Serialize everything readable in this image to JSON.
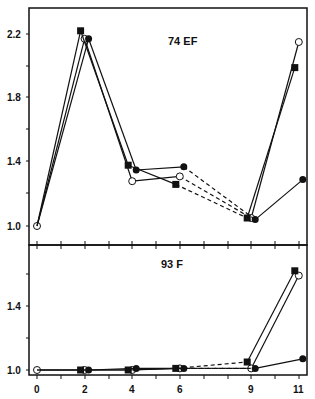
{
  "chart_data": [
    {
      "type": "line",
      "title": "74 EF",
      "xlabel": "",
      "ylabel": "",
      "x": [
        0,
        2,
        4,
        6,
        9,
        11
      ],
      "ylim": [
        0.95,
        2.35
      ],
      "yticks": [
        1.0,
        1.4,
        1.8,
        2.2
      ],
      "ytick_labels": [
        "1.0",
        "1.4",
        "1.8",
        "2.2"
      ],
      "grid": false,
      "series": [
        {
          "name": "open circle",
          "marker": "open-circle",
          "values": [
            1.0,
            2.17,
            1.28,
            1.31,
            1.05,
            2.15
          ]
        },
        {
          "name": "filled square",
          "marker": "filled-square",
          "values": [
            1.0,
            2.22,
            1.38,
            1.26,
            1.05,
            1.99
          ]
        },
        {
          "name": "filled circle",
          "marker": "filled-circle",
          "values": [
            1.0,
            2.17,
            1.35,
            1.37,
            1.04,
            1.29
          ]
        }
      ],
      "notes": "Solid lines between 0-4 and 4-6 and 9-11; dashed lines between 6 and 9"
    },
    {
      "type": "line",
      "title": "93 F",
      "xlabel": "",
      "ylabel": "",
      "x": [
        0,
        2,
        4,
        6,
        9,
        11
      ],
      "xticks": [
        0,
        2,
        4,
        6,
        9,
        11
      ],
      "xtick_labels": [
        "0",
        "2",
        "4",
        "6",
        "9",
        "11"
      ],
      "ylim": [
        0.97,
        1.8
      ],
      "yticks": [
        1.0,
        1.4
      ],
      "ytick_labels": [
        "1.0",
        "1.4"
      ],
      "grid": false,
      "series": [
        {
          "name": "open circle",
          "marker": "open-circle",
          "values": [
            1.0,
            1.0,
            1.0,
            1.01,
            1.01,
            1.59
          ]
        },
        {
          "name": "filled square",
          "marker": "filled-square",
          "values": [
            1.0,
            1.0,
            1.0,
            1.01,
            1.05,
            1.62
          ]
        },
        {
          "name": "filled circle",
          "marker": "filled-circle",
          "values": [
            1.0,
            1.0,
            1.01,
            1.01,
            1.01,
            1.07
          ]
        }
      ],
      "notes": "Dashed lines between 6 and 9"
    }
  ],
  "panels": {
    "top": {
      "title": "74 EF",
      "y_labels": [
        "2.2",
        "1.8",
        "1.4",
        "1.0"
      ]
    },
    "bottom": {
      "title": "93 F",
      "y_labels": [
        "1.4",
        "1.0"
      ],
      "x_labels": [
        "0",
        "2",
        "4",
        "6",
        "9",
        "11"
      ]
    }
  }
}
